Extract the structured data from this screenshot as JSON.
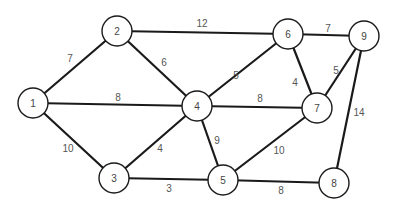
{
  "graph": {
    "type": "weighted-undirected",
    "colors": {
      "stroke": "#1a1a1a",
      "node_fill": "#ffffff",
      "label": "#555555"
    },
    "nodes": [
      {
        "id": "1",
        "label": "1"
      },
      {
        "id": "2",
        "label": "2"
      },
      {
        "id": "3",
        "label": "3"
      },
      {
        "id": "4",
        "label": "4"
      },
      {
        "id": "5",
        "label": "5"
      },
      {
        "id": "6",
        "label": "6"
      },
      {
        "id": "7",
        "label": "7"
      },
      {
        "id": "8",
        "label": "8"
      },
      {
        "id": "9",
        "label": "9"
      }
    ],
    "edges": [
      {
        "from": "1",
        "to": "2",
        "weight": "7"
      },
      {
        "from": "1",
        "to": "4",
        "weight": "8"
      },
      {
        "from": "1",
        "to": "3",
        "weight": "10"
      },
      {
        "from": "2",
        "to": "6",
        "weight": "12"
      },
      {
        "from": "2",
        "to": "4",
        "weight": "6"
      },
      {
        "from": "3",
        "to": "4",
        "weight": "4"
      },
      {
        "from": "3",
        "to": "5",
        "weight": "3"
      },
      {
        "from": "4",
        "to": "6",
        "weight": "5"
      },
      {
        "from": "4",
        "to": "7",
        "weight": "8"
      },
      {
        "from": "4",
        "to": "5",
        "weight": "9"
      },
      {
        "from": "6",
        "to": "9",
        "weight": "7"
      },
      {
        "from": "6",
        "to": "7",
        "weight": "4"
      },
      {
        "from": "7",
        "to": "9",
        "weight": "5"
      },
      {
        "from": "5",
        "to": "7",
        "weight": "10"
      },
      {
        "from": "5",
        "to": "8",
        "weight": "8"
      },
      {
        "from": "8",
        "to": "9",
        "weight": "14"
      }
    ]
  }
}
